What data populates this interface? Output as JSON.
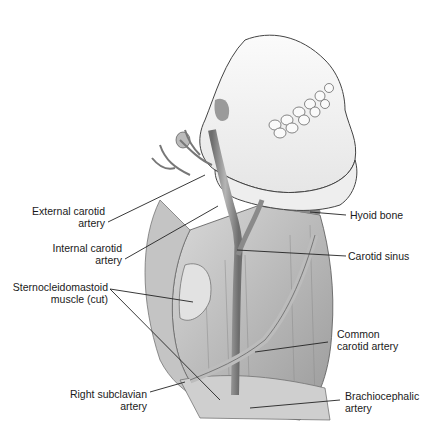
{
  "figure": {
    "labels": {
      "external_carotid": {
        "line1": "External carotid",
        "line2": "artery"
      },
      "internal_carotid": {
        "line1": "Internal carotid",
        "line2": "artery"
      },
      "sternocleidomastoid": {
        "line1": "Sternocleidomastoid",
        "line2": "muscle (cut)"
      },
      "right_subclavian": {
        "line1": "Right subclavian",
        "line2": "artery"
      },
      "hyoid_bone": {
        "line1": "Hyoid bone"
      },
      "carotid_sinus": {
        "line1": "Carotid sinus"
      },
      "common_carotid": {
        "line1": "Common",
        "line2": "carotid artery"
      },
      "brachiocephalic": {
        "line1": "Brachiocephalic",
        "line2": "artery"
      }
    }
  }
}
